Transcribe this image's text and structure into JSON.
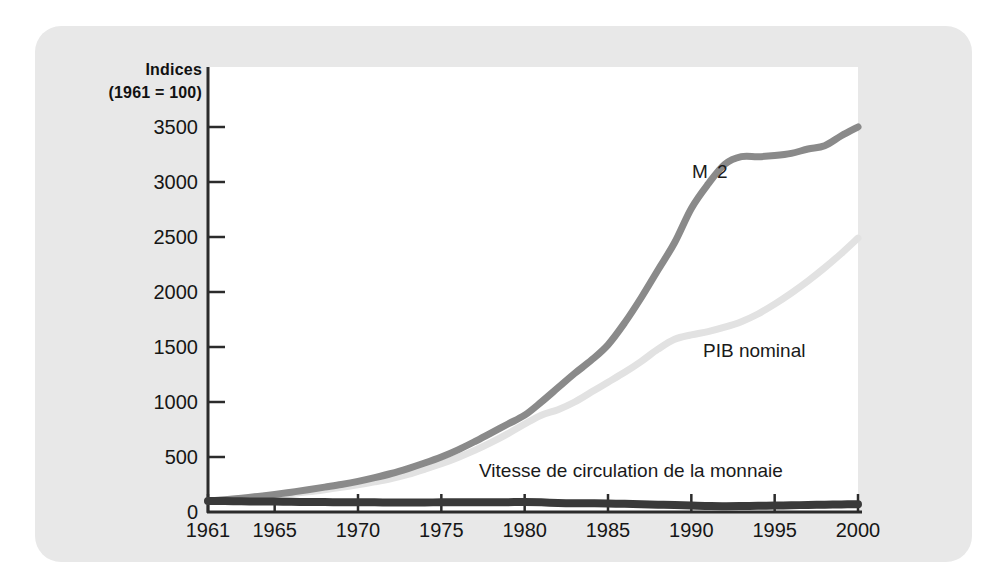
{
  "axis_title": {
    "line1": "Indices",
    "line2": "(1961 = 100)"
  },
  "labels": {
    "m2": "M 2",
    "pib": "PIB nominal",
    "velocity": "Vitesse de circulation de la monnaie"
  },
  "colors": {
    "panel": "#e8e8e8",
    "plot_background": "#ffffff",
    "axis": "#2b2b2b",
    "m2": "#8a8a8a",
    "pib": "#e2e2e2",
    "velocity": "#3a3a3a",
    "text": "#161616"
  },
  "chart_data": {
    "type": "line",
    "title": "",
    "subtitle": "",
    "xlabel": "",
    "ylabel": "Indices (1961 = 100)",
    "xlim": [
      1961,
      2000
    ],
    "ylim": [
      0,
      3700
    ],
    "grid": false,
    "legend": "inline-annotations",
    "x_ticks": [
      1961,
      1965,
      1970,
      1975,
      1980,
      1985,
      1990,
      1995,
      2000
    ],
    "y_ticks": [
      0,
      500,
      1000,
      1500,
      2000,
      2500,
      3000,
      3500
    ],
    "x": [
      1961,
      1962,
      1963,
      1964,
      1965,
      1966,
      1967,
      1968,
      1969,
      1970,
      1971,
      1972,
      1973,
      1974,
      1975,
      1976,
      1977,
      1978,
      1979,
      1980,
      1981,
      1982,
      1983,
      1984,
      1985,
      1986,
      1987,
      1988,
      1989,
      1990,
      1991,
      1992,
      1993,
      1994,
      1995,
      1996,
      1997,
      1998,
      1999,
      2000
    ],
    "series": [
      {
        "name": "M 2",
        "color": "#8a8a8a",
        "width": 7,
        "values": [
          100,
          112,
          126,
          142,
          160,
          180,
          202,
          226,
          250,
          278,
          312,
          350,
          395,
          445,
          500,
          565,
          640,
          720,
          800,
          880,
          1000,
          1130,
          1260,
          1380,
          1520,
          1720,
          1950,
          2200,
          2450,
          2760,
          2980,
          3160,
          3230,
          3230,
          3240,
          3260,
          3300,
          3330,
          3420,
          3500
        ]
      },
      {
        "name": "PIB nominal",
        "color": "#e2e2e2",
        "width": 7,
        "values": [
          100,
          110,
          122,
          136,
          152,
          168,
          184,
          203,
          224,
          248,
          274,
          304,
          342,
          388,
          438,
          496,
          560,
          632,
          712,
          800,
          880,
          930,
          1000,
          1090,
          1180,
          1270,
          1370,
          1480,
          1570,
          1610,
          1640,
          1680,
          1730,
          1800,
          1890,
          1990,
          2100,
          2220,
          2350,
          2490
        ]
      },
      {
        "name": "Vitesse de circulation de la monnaie",
        "color": "#3a3a3a",
        "width": 8,
        "values": [
          100,
          99,
          97,
          96,
          95,
          93,
          91,
          90,
          89,
          89,
          88,
          87,
          87,
          87,
          88,
          88,
          88,
          88,
          89,
          91,
          88,
          82,
          79,
          79,
          78,
          74,
          70,
          67,
          64,
          58,
          55,
          53,
          54,
          56,
          58,
          61,
          64,
          67,
          69,
          71
        ]
      }
    ]
  }
}
